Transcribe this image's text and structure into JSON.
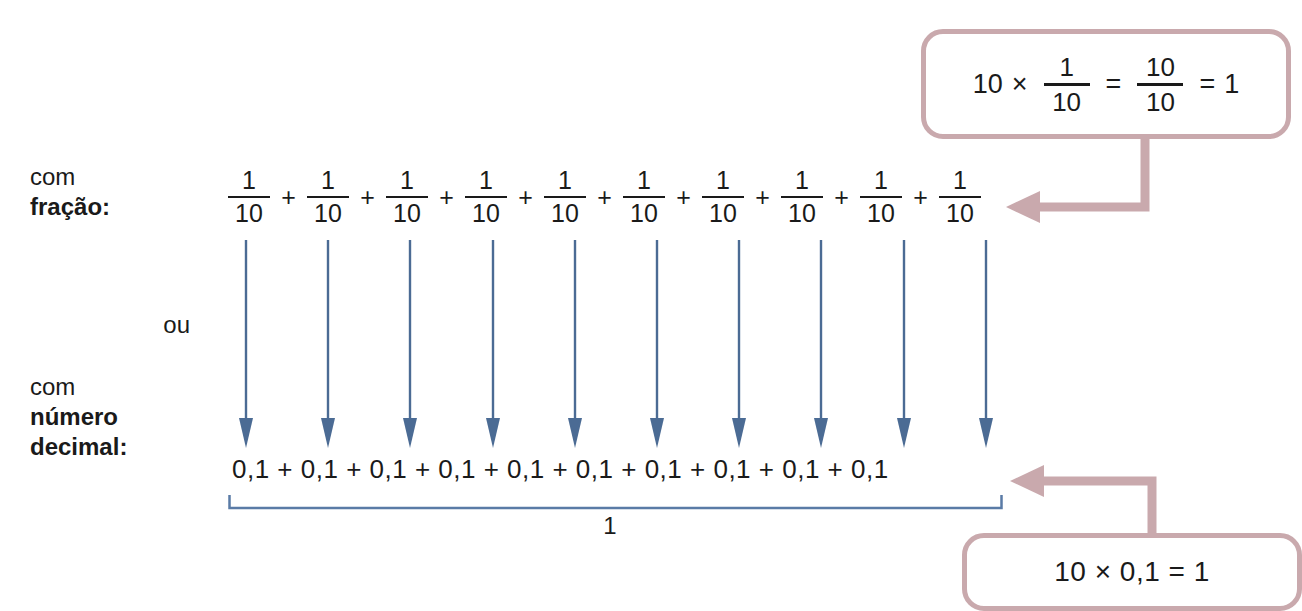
{
  "page": {
    "language": "pt-BR",
    "background_color": "#ffffff"
  },
  "colors": {
    "text": "#1a1a1a",
    "arrow_blue": "#4b6b94",
    "brace_blue": "#5a7ba6",
    "callout_mauve": "#c9a9ad"
  },
  "labels": {
    "fracao_line1": "com",
    "fracao_line2": "fração:",
    "ou": "ou",
    "decimal_line1": "com",
    "decimal_line2": "número",
    "decimal_line3": "decimal:"
  },
  "fraction_row": {
    "term_count": 10,
    "numerator": "1",
    "denominator": "10",
    "operator": "+",
    "terms": [
      {
        "num": "1",
        "den": "10"
      },
      {
        "num": "1",
        "den": "10"
      },
      {
        "num": "1",
        "den": "10"
      },
      {
        "num": "1",
        "den": "10"
      },
      {
        "num": "1",
        "den": "10"
      },
      {
        "num": "1",
        "den": "10"
      },
      {
        "num": "1",
        "den": "10"
      },
      {
        "num": "1",
        "den": "10"
      },
      {
        "num": "1",
        "den": "10"
      },
      {
        "num": "1",
        "den": "10"
      }
    ]
  },
  "decimal_row": {
    "term_count": 10,
    "term": "0,1",
    "operator": "+",
    "expression": "0,1 + 0,1 + 0,1 + 0,1 + 0,1 + 0,1 + 0,1 + 0,1 + 0,1 + 0,1"
  },
  "brace": {
    "value": "1"
  },
  "callout_fraction": {
    "multiplier": "10",
    "times": "×",
    "frac1_num": "1",
    "frac1_den": "10",
    "equals1": "=",
    "frac2_num": "10",
    "frac2_den": "10",
    "equals2": "=",
    "result": "1"
  },
  "callout_decimal": {
    "text": "10 × 0,1 = 1"
  },
  "arrows": {
    "blue_arrow_count": 10,
    "description": "vertical blue arrows linking each fraction to its decimal equivalent"
  }
}
